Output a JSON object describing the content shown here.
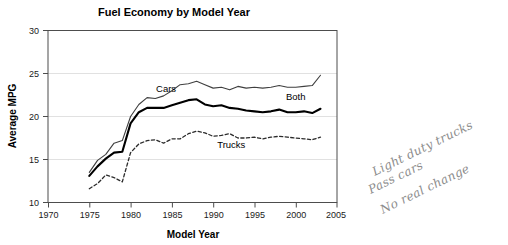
{
  "chart_data": {
    "type": "line",
    "title": "Fuel Economy by Model Year",
    "xlabel": "Model Year",
    "ylabel": "Average MPG",
    "xlim": [
      1970,
      2005
    ],
    "ylim": [
      10,
      30
    ],
    "xticks": [
      1970,
      1975,
      1980,
      1985,
      1990,
      1995,
      2000,
      2005
    ],
    "yticks": [
      10,
      15,
      20,
      25,
      30
    ],
    "grid": "horizontal",
    "legend": "inline-labels",
    "x": [
      1975,
      1976,
      1977,
      1978,
      1979,
      1980,
      1981,
      1982,
      1983,
      1984,
      1985,
      1986,
      1987,
      1988,
      1989,
      1990,
      1991,
      1992,
      1993,
      1994,
      1995,
      1996,
      1997,
      1998,
      1999,
      2000,
      2001,
      2002,
      2003
    ],
    "series": [
      {
        "name": "Cars",
        "style": "thin-solid",
        "values": [
          13.5,
          14.9,
          15.6,
          16.9,
          17.2,
          20.0,
          21.4,
          22.2,
          22.1,
          22.4,
          23.0,
          23.7,
          23.8,
          24.1,
          23.7,
          23.3,
          23.4,
          23.1,
          23.5,
          23.3,
          23.4,
          23.3,
          23.4,
          23.6,
          23.4,
          23.4,
          23.5,
          23.6,
          24.8
        ]
      },
      {
        "name": "Both",
        "style": "thick-solid",
        "values": [
          13.1,
          14.2,
          15.1,
          15.8,
          15.9,
          19.2,
          20.5,
          21.0,
          21.0,
          21.0,
          21.3,
          21.6,
          21.9,
          22.0,
          21.4,
          21.2,
          21.3,
          21.0,
          20.9,
          20.7,
          20.6,
          20.5,
          20.6,
          20.8,
          20.5,
          20.5,
          20.6,
          20.4,
          20.9
        ]
      },
      {
        "name": "Trucks",
        "style": "dashed",
        "values": [
          11.6,
          12.2,
          13.2,
          12.9,
          12.4,
          15.8,
          16.8,
          17.2,
          17.3,
          16.9,
          17.4,
          17.4,
          18.0,
          18.3,
          18.1,
          17.7,
          17.8,
          18.0,
          17.5,
          17.5,
          17.6,
          17.4,
          17.6,
          17.7,
          17.6,
          17.5,
          17.4,
          17.3,
          17.6
        ]
      }
    ],
    "annotations": [
      {
        "text": "Cars",
        "x": 1984.3,
        "y": 22.9
      },
      {
        "text": "Both",
        "x": 2000.0,
        "y": 21.9
      },
      {
        "text": "Trucks",
        "x": 1992.2,
        "y": 16.3
      }
    ]
  },
  "handwritten_note": {
    "line1": "Light duty trucks",
    "line2": "Pass cars",
    "line3": "No real change"
  }
}
